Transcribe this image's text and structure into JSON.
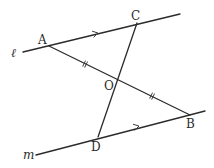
{
  "diagram": {
    "type": "geometry",
    "lines": [
      {
        "id": "l",
        "label": "ℓ",
        "parallel_marker": "single-arrow"
      },
      {
        "id": "m",
        "label": "m",
        "parallel_marker": "single-arrow"
      }
    ],
    "points": {
      "A": {
        "label": "A",
        "on": "l"
      },
      "C": {
        "label": "C",
        "on": "l"
      },
      "D": {
        "label": "D",
        "on": "m"
      },
      "B": {
        "label": "B",
        "on": "m"
      },
      "O": {
        "label": "O",
        "note": "intersection of AB and CD"
      }
    },
    "segments": [
      "AB",
      "CD"
    ],
    "equal_marks": [
      {
        "segment": "AO",
        "ticks": 2
      },
      {
        "segment": "OB",
        "ticks": 2
      }
    ]
  },
  "labels": {
    "line_l": "ℓ",
    "line_m": "m",
    "point_A": "A",
    "point_B": "B",
    "point_C": "C",
    "point_D": "D",
    "point_O": "O"
  },
  "colors": {
    "stroke": "#2b2b2b",
    "background": "#ffffff"
  }
}
